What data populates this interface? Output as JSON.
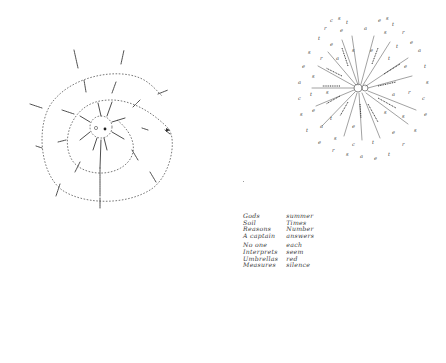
{
  "page": {
    "background": "#ffffff",
    "ink_color": "#2a2a2a"
  },
  "diagrams": {
    "spiral": {
      "kind": "spiral word diagram",
      "center": [
        96,
        127
      ],
      "center_label_note": "small circle with dot and short illegible handwritten label",
      "style": "dashed spiral line with short handwritten word branches radiating outward",
      "label_count_approx": 24,
      "labels_legible": false
    },
    "starburst": {
      "kind": "radial word starburst",
      "center": [
        358,
        88
      ],
      "ray_count_approx": 20,
      "style": "straight rays from a small central circle, each ray lined with handwritten words, surrounded by scattered handwritten letters",
      "labels_legible": false
    }
  },
  "word_list": {
    "left_column": {
      "group1": [
        "Gods",
        "Soil",
        "Reasons",
        "A captain"
      ],
      "group2": [
        "No one",
        "Interprets",
        "Umbrellas",
        "Measures"
      ]
    },
    "right_column": {
      "group1": [
        "summer",
        "Times",
        "Number",
        "answers"
      ],
      "group2": [
        "each",
        "seem",
        "red",
        "silence"
      ]
    }
  }
}
